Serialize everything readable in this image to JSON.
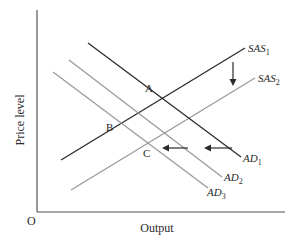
{
  "diagram": {
    "y_axis_label": "Price level",
    "x_axis_label": "Output",
    "origin_label": "O",
    "curves": [
      {
        "id": "SAS1",
        "label_main": "SAS",
        "label_sub": "1",
        "color": "#2b2b2b",
        "from": [
          61,
          160
        ],
        "to": [
          245,
          48
        ]
      },
      {
        "id": "SAS2",
        "label_main": "SAS",
        "label_sub": "2",
        "color": "#9a9a9a",
        "from": [
          71,
          190
        ],
        "to": [
          255,
          78
        ]
      },
      {
        "id": "AD1",
        "label_main": "AD",
        "label_sub": "1",
        "color": "#2b2b2b",
        "from": [
          88,
          43
        ],
        "to": [
          241,
          157
        ]
      },
      {
        "id": "AD2",
        "label_main": "AD",
        "label_sub": "2",
        "color": "#9a9a9a",
        "from": [
          69,
          60
        ],
        "to": [
          222,
          177
        ]
      },
      {
        "id": "AD3",
        "label_main": "AD",
        "label_sub": "3",
        "color": "#9a9a9a",
        "from": [
          53,
          72
        ],
        "to": [
          208,
          188
        ]
      }
    ],
    "points": [
      {
        "label": "A",
        "x": 149,
        "y": 91
      },
      {
        "label": "B",
        "x": 110,
        "y": 130
      },
      {
        "label": "C",
        "x": 146,
        "y": 156
      }
    ],
    "arrows": [
      {
        "direction": "down",
        "meaning": "SAS shifts down"
      },
      {
        "direction": "left",
        "meaning": "AD shifts left"
      },
      {
        "direction": "left",
        "meaning": "AD shifts left"
      }
    ],
    "colors": {
      "axis": "#555555",
      "dark_line": "#2b2b2b",
      "light_line": "#9a9a9a",
      "text": "#2a2a2a"
    }
  }
}
